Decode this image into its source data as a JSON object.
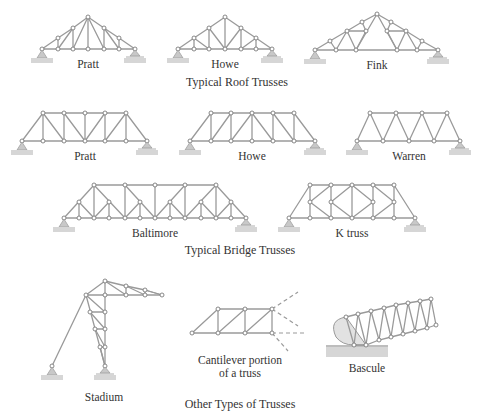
{
  "sections": {
    "roof": {
      "caption": "Typical Roof Trusses",
      "items": [
        {
          "label": "Pratt"
        },
        {
          "label": "Howe"
        },
        {
          "label": "Fink"
        }
      ]
    },
    "bridge": {
      "caption": "Typical Bridge Trusses",
      "items": [
        {
          "label": "Pratt"
        },
        {
          "label": "Howe"
        },
        {
          "label": "Warren"
        },
        {
          "label": "Baltimore"
        },
        {
          "label": "K truss"
        }
      ]
    },
    "other": {
      "caption": "Other Types of Trusses",
      "items": [
        {
          "label": "Stadium"
        },
        {
          "label": "Cantilever portion of a truss",
          "line1": "Cantilever portion",
          "line2": "of a truss"
        },
        {
          "label": "Bascule"
        }
      ]
    }
  },
  "colors": {
    "member": "#9a9a9a",
    "joint_fill": "#ffffff",
    "ground": "#d6d6d6",
    "text": "#333333"
  }
}
